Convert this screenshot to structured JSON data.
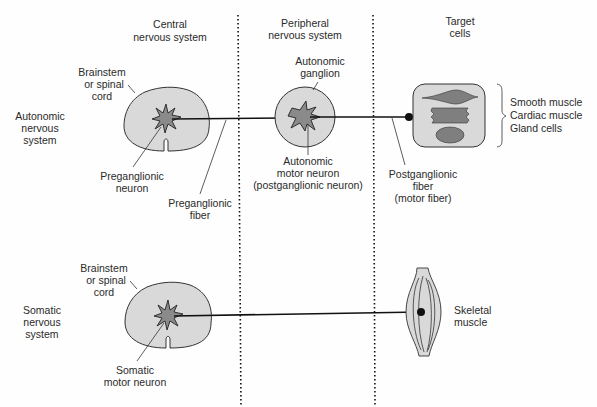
{
  "columns": {
    "cns": [
      "Central",
      "nervous system"
    ],
    "pns": [
      "Peripheral",
      "nervous system"
    ],
    "target": [
      "Target",
      "cells"
    ]
  },
  "rows": {
    "autonomic": [
      "Autonomic",
      "nervous",
      "system"
    ],
    "somatic": [
      "Somatic",
      "nervous",
      "system"
    ]
  },
  "autonomic": {
    "cord_label": [
      "Brainstem",
      "or spinal",
      "cord"
    ],
    "preganglionic_neuron": [
      "Preganglionic",
      "neuron"
    ],
    "preganglionic_fiber": [
      "Preganglionic",
      "fiber"
    ],
    "ganglion_label": [
      "Autonomic",
      "ganglion"
    ],
    "motor_neuron": [
      "Autonomic",
      "motor neuron",
      "(postganglionic neuron)"
    ],
    "postganglionic_fiber": [
      "Postganglionic",
      "fiber",
      "(motor fiber)"
    ],
    "targets": [
      "Smooth muscle",
      "Cardiac muscle",
      "Gland cells"
    ]
  },
  "somatic": {
    "cord_label": [
      "Brainstem",
      "or spinal",
      "cord"
    ],
    "motor_neuron": [
      "Somatic",
      "motor neuron"
    ],
    "target": [
      "Skeletal",
      "muscle"
    ]
  },
  "colors": {
    "tissue_fill": "#d9d9d9",
    "neuron_fill": "#8a8a8a",
    "line": "#111111"
  }
}
